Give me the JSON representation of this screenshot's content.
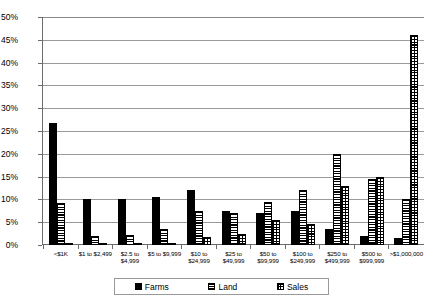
{
  "chart_data": {
    "type": "bar",
    "title": "",
    "xlabel": "",
    "ylabel": "",
    "ylim": [
      0,
      50
    ],
    "ytick_labels": [
      "50%",
      "45%",
      "40%",
      "35%",
      "30%",
      "25%",
      "20%",
      "15%",
      "10%",
      "5%",
      "0%"
    ],
    "ytick_values": [
      50,
      45,
      40,
      35,
      30,
      25,
      20,
      15,
      10,
      5,
      0
    ],
    "grid": true,
    "legend_position": "bottom",
    "categories": [
      "<$1K",
      "$1 to $2,499",
      "$2.5 to\n$4,999",
      "$5 to $9,999",
      "$10 to\n$24,999",
      "$25 to\n$49,999",
      "$50 to\n$99,999",
      "$100 to\n$249,999",
      "$250 to\n$499,999",
      "$500 to\n$999,999",
      ">$1,000,000"
    ],
    "series": [
      {
        "name": "Farms",
        "pattern": "solid-black",
        "values": [
          26.7,
          10.0,
          10.0,
          10.5,
          12.0,
          7.5,
          7.0,
          7.5,
          3.5,
          2.0,
          1.5
        ]
      },
      {
        "name": "Land",
        "pattern": "horizontal-stripes",
        "values": [
          9.3,
          2.0,
          2.2,
          3.5,
          7.5,
          7.0,
          9.5,
          12.0,
          20.0,
          14.5,
          10.0
        ]
      },
      {
        "name": "Sales",
        "pattern": "cross-hatch",
        "values": [
          0.5,
          0.2,
          0.3,
          0.5,
          1.8,
          2.5,
          5.5,
          4.5,
          13.0,
          15.0,
          46.0
        ]
      }
    ]
  },
  "legend": {
    "items": [
      {
        "label": "Farms"
      },
      {
        "label": "Land"
      },
      {
        "label": "Sales"
      }
    ]
  },
  "colors": {
    "axis": "#6b6b6b",
    "gridline": "#9a9a9a",
    "bar_outline": "#000000",
    "background": "#ffffff"
  }
}
